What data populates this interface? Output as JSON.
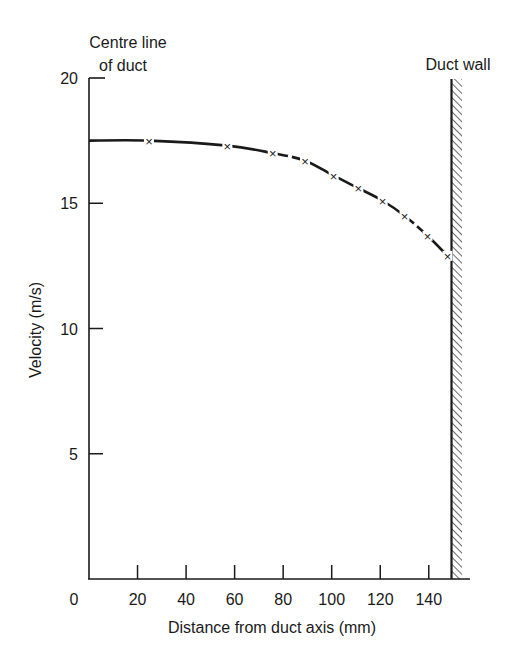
{
  "chart_data": {
    "type": "line",
    "title": "",
    "xlabel": "Distance from duct axis (mm)",
    "ylabel": "Velocity (m/s)",
    "xlim": [
      0,
      150
    ],
    "ylim": [
      0,
      20
    ],
    "x_ticks": [
      0,
      20,
      40,
      60,
      80,
      100,
      120,
      140
    ],
    "y_ticks": [
      5,
      10,
      15,
      20
    ],
    "grid": false,
    "legend": null,
    "annotations": [
      {
        "text": "Centre line of duct",
        "lines": [
          "Centre line",
          "of duct"
        ],
        "at": "x=0 (top-left)"
      },
      {
        "text": "Duct wall",
        "at": "x=150 (hatched vertical wall)"
      }
    ],
    "series": [
      {
        "name": "Velocity profile",
        "marker": "x",
        "line_style": "dashed",
        "x": [
          24.7,
          57,
          75.7,
          89,
          100.8,
          111,
          121,
          130,
          139.5,
          147.7
        ],
        "values": [
          17.5,
          17.3,
          17.0,
          16.7,
          16.1,
          15.6,
          15.1,
          14.5,
          13.7,
          12.9
        ]
      }
    ],
    "curve_start": {
      "x": 0,
      "y": 17.5
    }
  },
  "labels": {
    "centre_line_1": "Centre line",
    "centre_line_2": "of duct",
    "duct_wall": "Duct wall",
    "xlabel": "Distance from duct axis (mm)",
    "ylabel": "Velocity (m/s)",
    "x_zero": "0"
  },
  "colors": {
    "ink": "#1a1a1a",
    "background": "#ffffff"
  }
}
